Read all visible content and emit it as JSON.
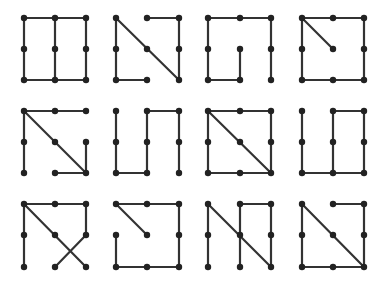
{
  "diagram": {
    "colors": {
      "line": "#333333",
      "dot": "#222222",
      "background": "#ffffff"
    },
    "layout": {
      "col_x": [
        [
          24,
          55,
          86
        ],
        [
          116,
          147,
          179
        ],
        [
          208,
          240,
          271
        ],
        [
          302,
          333,
          364
        ]
      ],
      "row_y": [
        [
          18,
          49,
          80
        ],
        [
          111,
          142,
          173
        ],
        [
          204,
          235,
          267
        ]
      ]
    },
    "figures": [
      {
        "id": 1,
        "row": 0,
        "col": 0,
        "edges": [
          [
            [
              0,
              0
            ],
            [
              2,
              0
            ]
          ],
          [
            [
              0,
              0
            ],
            [
              0,
              2
            ]
          ],
          [
            [
              1,
              0
            ],
            [
              1,
              2
            ]
          ],
          [
            [
              2,
              0
            ],
            [
              2,
              2
            ]
          ],
          [
            [
              0,
              2
            ],
            [
              2,
              2
            ]
          ]
        ]
      },
      {
        "id": 2,
        "row": 0,
        "col": 1,
        "edges": [
          [
            [
              1,
              0
            ],
            [
              2,
              0
            ]
          ],
          [
            [
              2,
              0
            ],
            [
              2,
              2
            ]
          ],
          [
            [
              2,
              2
            ],
            [
              0,
              0
            ]
          ],
          [
            [
              0,
              0
            ],
            [
              0,
              2
            ]
          ],
          [
            [
              0,
              2
            ],
            [
              1,
              2
            ]
          ]
        ]
      },
      {
        "id": 3,
        "row": 0,
        "col": 2,
        "edges": [
          [
            [
              0,
              0
            ],
            [
              2,
              0
            ]
          ],
          [
            [
              2,
              0
            ],
            [
              2,
              2
            ]
          ],
          [
            [
              0,
              0
            ],
            [
              0,
              2
            ]
          ],
          [
            [
              0,
              2
            ],
            [
              1,
              2
            ]
          ],
          [
            [
              1,
              2
            ],
            [
              1,
              1
            ]
          ]
        ]
      },
      {
        "id": 4,
        "row": 0,
        "col": 3,
        "edges": [
          [
            [
              0,
              0
            ],
            [
              2,
              0
            ]
          ],
          [
            [
              2,
              0
            ],
            [
              2,
              2
            ]
          ],
          [
            [
              2,
              2
            ],
            [
              0,
              2
            ]
          ],
          [
            [
              0,
              2
            ],
            [
              0,
              0
            ]
          ],
          [
            [
              0,
              0
            ],
            [
              1,
              1
            ]
          ]
        ]
      },
      {
        "id": 5,
        "row": 1,
        "col": 0,
        "edges": [
          [
            [
              0,
              0
            ],
            [
              2,
              0
            ]
          ],
          [
            [
              0,
              0
            ],
            [
              0,
              2
            ]
          ],
          [
            [
              0,
              0
            ],
            [
              2,
              2
            ]
          ],
          [
            [
              2,
              2
            ],
            [
              1,
              2
            ]
          ],
          [
            [
              2,
              2
            ],
            [
              2,
              1
            ]
          ]
        ]
      },
      {
        "id": 6,
        "row": 1,
        "col": 1,
        "edges": [
          [
            [
              0,
              0
            ],
            [
              0,
              2
            ]
          ],
          [
            [
              0,
              2
            ],
            [
              1,
              2
            ]
          ],
          [
            [
              1,
              2
            ],
            [
              1,
              0
            ]
          ],
          [
            [
              1,
              0
            ],
            [
              2,
              0
            ]
          ],
          [
            [
              2,
              0
            ],
            [
              2,
              2
            ]
          ]
        ]
      },
      {
        "id": 7,
        "row": 1,
        "col": 2,
        "edges": [
          [
            [
              0,
              0
            ],
            [
              2,
              0
            ]
          ],
          [
            [
              2,
              0
            ],
            [
              2,
              2
            ]
          ],
          [
            [
              2,
              2
            ],
            [
              0,
              2
            ]
          ],
          [
            [
              0,
              2
            ],
            [
              0,
              0
            ]
          ],
          [
            [
              0,
              0
            ],
            [
              2,
              2
            ]
          ]
        ]
      },
      {
        "id": 8,
        "row": 1,
        "col": 3,
        "edges": [
          [
            [
              0,
              0
            ],
            [
              0,
              2
            ]
          ],
          [
            [
              0,
              2
            ],
            [
              2,
              2
            ]
          ],
          [
            [
              1,
              2
            ],
            [
              1,
              0
            ]
          ],
          [
            [
              1,
              0
            ],
            [
              2,
              0
            ]
          ],
          [
            [
              2,
              0
            ],
            [
              2,
              2
            ]
          ]
        ]
      },
      {
        "id": 9,
        "row": 2,
        "col": 0,
        "edges": [
          [
            [
              0,
              0
            ],
            [
              2,
              0
            ]
          ],
          [
            [
              2,
              0
            ],
            [
              2,
              1
            ]
          ],
          [
            [
              2,
              1
            ],
            [
              1,
              2
            ]
          ],
          [
            [
              0,
              0
            ],
            [
              2,
              2
            ]
          ],
          [
            [
              0,
              0
            ],
            [
              0,
              2
            ]
          ]
        ]
      },
      {
        "id": 10,
        "row": 2,
        "col": 1,
        "edges": [
          [
            [
              0,
              0
            ],
            [
              2,
              0
            ]
          ],
          [
            [
              2,
              0
            ],
            [
              2,
              2
            ]
          ],
          [
            [
              2,
              2
            ],
            [
              0,
              2
            ]
          ],
          [
            [
              0,
              2
            ],
            [
              0,
              1
            ]
          ],
          [
            [
              0,
              0
            ],
            [
              1,
              1
            ]
          ]
        ]
      },
      {
        "id": 11,
        "row": 2,
        "col": 2,
        "edges": [
          [
            [
              0,
              0
            ],
            [
              0,
              2
            ]
          ],
          [
            [
              0,
              0
            ],
            [
              2,
              2
            ]
          ],
          [
            [
              1,
              0
            ],
            [
              2,
              0
            ]
          ],
          [
            [
              1,
              0
            ],
            [
              1,
              2
            ]
          ],
          [
            [
              2,
              0
            ],
            [
              2,
              2
            ]
          ]
        ]
      },
      {
        "id": 12,
        "row": 2,
        "col": 3,
        "edges": [
          [
            [
              1,
              0
            ],
            [
              2,
              0
            ]
          ],
          [
            [
              2,
              0
            ],
            [
              2,
              2
            ]
          ],
          [
            [
              0,
              0
            ],
            [
              2,
              2
            ]
          ],
          [
            [
              0,
              0
            ],
            [
              0,
              2
            ]
          ],
          [
            [
              0,
              2
            ],
            [
              2,
              2
            ]
          ]
        ]
      }
    ]
  }
}
